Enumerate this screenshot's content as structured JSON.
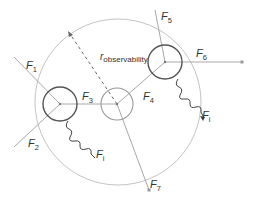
{
  "diagram": {
    "colors": {
      "observability_circle": "#c0c0c0",
      "node_dark": "#555555",
      "node_light": "#9a9a9a",
      "force_line": "#a8a8a8",
      "wavy_line": "#444444",
      "text": "#333333"
    },
    "radius_label": {
      "main": "r",
      "sub": "observability"
    },
    "nodes": [
      {
        "id": "left-node",
        "style": "dark"
      },
      {
        "id": "center-node",
        "style": "light"
      },
      {
        "id": "upper-right-node",
        "style": "dark"
      }
    ],
    "force_labels": [
      {
        "id": "F1",
        "main": "F",
        "sub": "1"
      },
      {
        "id": "F2",
        "main": "F",
        "sub": "2"
      },
      {
        "id": "F3",
        "main": "F",
        "sub": "3"
      },
      {
        "id": "F4",
        "main": "F",
        "sub": "4"
      },
      {
        "id": "F5",
        "main": "F",
        "sub": "5"
      },
      {
        "id": "F6",
        "main": "F",
        "sub": "6"
      },
      {
        "id": "F7",
        "main": "F",
        "sub": "7"
      },
      {
        "id": "Fi-left",
        "main": "F",
        "sub": "i"
      },
      {
        "id": "Fi-right",
        "main": "F",
        "sub": "i"
      }
    ]
  }
}
